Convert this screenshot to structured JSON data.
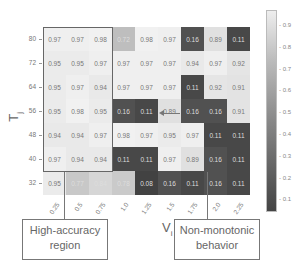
{
  "chart_data": {
    "type": "heatmap",
    "title": "",
    "xlabel": "V_i",
    "ylabel": "T_j",
    "x_categories": [
      "0.25",
      "0.5",
      "0.75",
      "1.0",
      "1.25",
      "1.5",
      "1.75",
      "2.0",
      "2.25"
    ],
    "y_categories": [
      "80",
      "72",
      "64",
      "56",
      "48",
      "40",
      "32"
    ],
    "values": [
      [
        0.97,
        0.97,
        0.98,
        0.72,
        0.98,
        0.97,
        0.16,
        0.89,
        0.11
      ],
      [
        0.95,
        0.95,
        0.97,
        0.97,
        0.97,
        0.97,
        0.94,
        0.97,
        0.92
      ],
      [
        0.95,
        0.97,
        0.94,
        0.97,
        0.97,
        0.97,
        0.11,
        0.92,
        0.91
      ],
      [
        0.95,
        0.98,
        0.95,
        0.16,
        0.11,
        0.89,
        0.16,
        0.16,
        0.91
      ],
      [
        0.94,
        0.94,
        0.97,
        0.98,
        0.97,
        0.95,
        0.97,
        0.11,
        0.11
      ],
      [
        0.97,
        0.94,
        0.94,
        0.11,
        0.11,
        0.97,
        0.89,
        0.16,
        0.11
      ],
      [
        0.95,
        0.77,
        0.84,
        0.78,
        0.08,
        0.16,
        0.11,
        0.16,
        0.11
      ]
    ],
    "colorbar": {
      "min": 0.05,
      "max": 1.0,
      "ticks": [
        "0.9",
        "0.8",
        "0.7",
        "0.6",
        "0.5",
        "0.4",
        "0.3",
        "0.2",
        "0.1"
      ],
      "colormap": "grayscale (dark=low, light=high)"
    },
    "annotations": [
      {
        "text": "High-accuracy region",
        "target": "V_i 0.25-0.75, T_j 40-80"
      },
      {
        "text": "Non-monotonic behavior",
        "target": "arrow near T_j 56, V_i 1.5"
      }
    ],
    "grid": false,
    "legend_position": "right colorbar"
  },
  "labels": {
    "xlabel_main": "V",
    "xlabel_sub": "i",
    "ylabel_main": "T",
    "ylabel_sub": "j",
    "annot_left": "High-accuracy region",
    "annot_left_l1": "High-accuracy",
    "annot_left_l2": "region",
    "annot_right_l1": "Non-monotonic",
    "annot_right_l2": "behavior"
  }
}
